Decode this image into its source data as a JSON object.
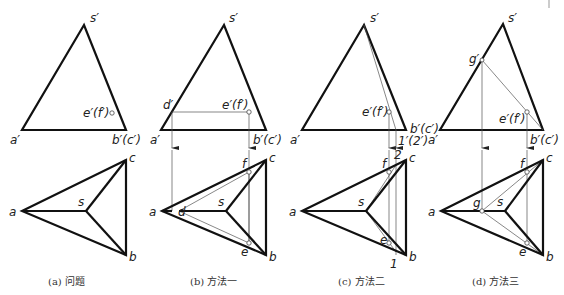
{
  "figure": {
    "panels": [
      {
        "id": "a",
        "caption": "(a) 问题",
        "front_view": {
          "apex": "s′",
          "left": "a′",
          "right": "b′(c′)",
          "point": "e′(f′)"
        },
        "top_view": {
          "a": "a",
          "s": "s",
          "b": "b",
          "c": "c"
        }
      },
      {
        "id": "b",
        "caption": "(b) 方法一",
        "front_view": {
          "apex": "s′",
          "left": "a′",
          "right": "b′(c′)",
          "aux_point": "d′",
          "point": "e′(f′)"
        },
        "top_view": {
          "a": "a",
          "s": "s",
          "b": "b",
          "c": "c",
          "d": "d",
          "e": "e",
          "f": "f"
        }
      },
      {
        "id": "c",
        "caption": "(c) 方法二",
        "front_view": {
          "apex": "s′",
          "left": "a′",
          "right": "b′(c′)",
          "point": "e′(f′)",
          "aux_point": "1′(2′)"
        },
        "top_view": {
          "a": "a",
          "s": "s",
          "b": "b",
          "c": "c",
          "e": "e",
          "f": "f",
          "p1": "1",
          "p2": "2"
        }
      },
      {
        "id": "d",
        "caption": "(d) 方法三",
        "front_view": {
          "apex": "s′",
          "left": "a′",
          "right": "b′(c′)",
          "aux_point": "g′",
          "point": "e′(f′)"
        },
        "top_view": {
          "a": "a",
          "s": "s",
          "b": "b",
          "c": "c",
          "g": "g",
          "e": "e",
          "f": "f"
        }
      }
    ]
  }
}
